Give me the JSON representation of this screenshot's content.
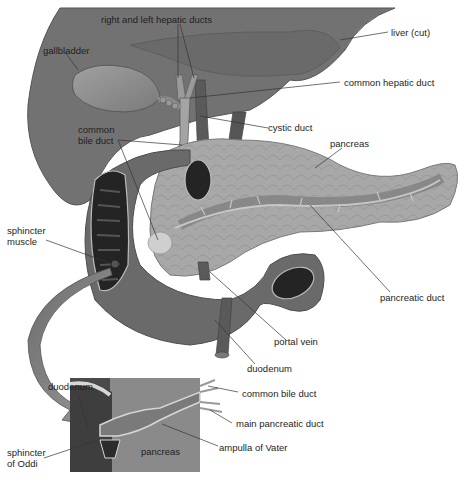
{
  "diagram": {
    "type": "anatomical-illustration",
    "colors": {
      "liver": "#6f6f6f",
      "liver_edge": "#4e4e4e",
      "gallbladder": "#8e8e8e",
      "pancreas": "#a6a6a6",
      "duodenum": "#6a6a6a",
      "duodenum_lumen": "#2a2a2a",
      "duct": "#b8b8b8",
      "arrow": "#8a8a8a",
      "inset_bg": "#7d7d7d",
      "leader_line": "#333333",
      "label_text": "#1e1e1e"
    },
    "labels": {
      "right_left_hepatic_ducts": "right and left hepatic ducts",
      "gallbladder": "gallbladder",
      "liver_cut": "liver (cut)",
      "common_hepatic_duct": "common hepatic duct",
      "common_bile_duct_l1": "common",
      "common_bile_duct_l2": "bile duct",
      "cystic_duct": "cystic duct",
      "pancreas": "pancreas",
      "sphincter_muscle_l1": "sphincter",
      "sphincter_muscle_l2": "muscle",
      "pancreatic_duct": "pancreatic duct",
      "portal_vein": "portal vein",
      "duodenum_main": "duodenum",
      "duodenum_inset": "duodenum",
      "inset_common_bile_duct": "common bile duct",
      "inset_main_pancreatic_duct": "main pancreatic duct",
      "inset_ampulla_of_vater": "ampulla of Vater",
      "inset_pancreas": "pancreas",
      "sphincter_oddi_l1": "sphincter",
      "sphincter_oddi_l2": "of Oddi"
    }
  }
}
